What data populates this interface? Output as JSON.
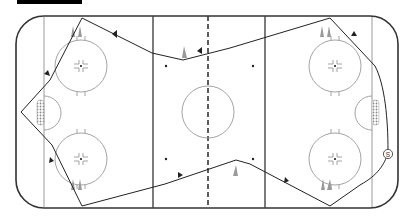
{
  "diagram": {
    "type": "hockey-rink-drill",
    "colors": {
      "boards": "#333333",
      "lines": "#555555",
      "circles": "#888888",
      "path": "#222222",
      "cones": "#999999",
      "net": "#777777"
    },
    "skater_label": "S",
    "cones": [
      {
        "x": 73,
        "y": 36
      },
      {
        "x": 85,
        "y": 36
      },
      {
        "x": 73,
        "y": 190
      },
      {
        "x": 85,
        "y": 190
      },
      {
        "x": 183,
        "y": 55
      },
      {
        "x": 236,
        "y": 178
      },
      {
        "x": 323,
        "y": 36
      },
      {
        "x": 335,
        "y": 36
      },
      {
        "x": 323,
        "y": 190
      },
      {
        "x": 335,
        "y": 190
      }
    ]
  }
}
